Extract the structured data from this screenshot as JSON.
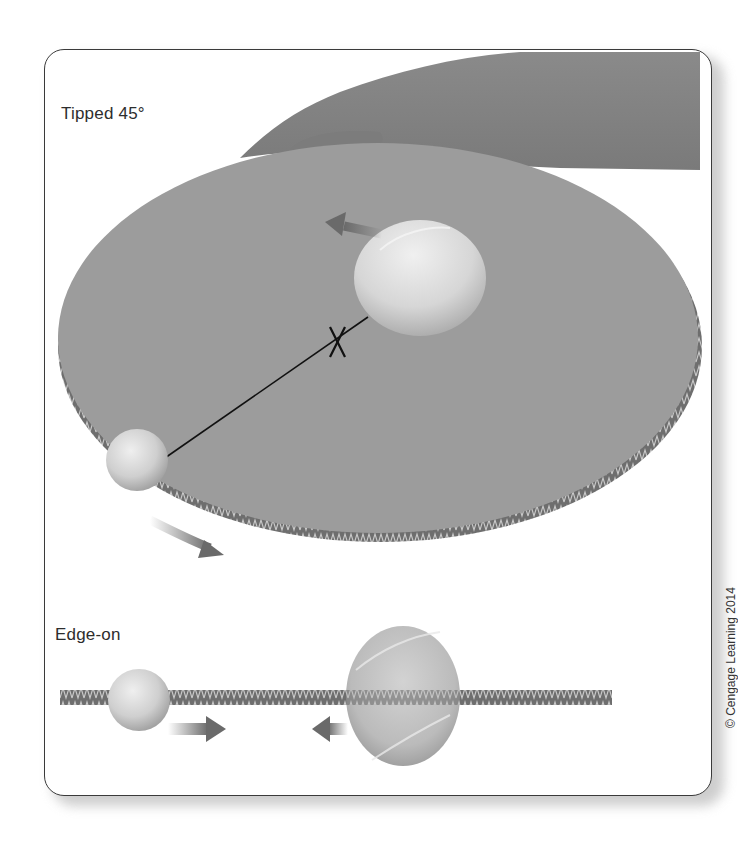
{
  "figure": {
    "top_panel": {
      "label": "Tipped 45°",
      "elements": [
        "hand-holding-disc",
        "cardboard-disc",
        "large-ball",
        "small-ball",
        "center-of-mass-marker",
        "connecting-line",
        "motion-arrow-large",
        "motion-arrow-small"
      ]
    },
    "bottom_panel": {
      "label": "Edge-on",
      "elements": [
        "corrugated-disc-edge",
        "small-ball",
        "large-ball",
        "motion-arrow-right",
        "motion-arrow-left"
      ]
    },
    "credit": "© Cengage Learning 2014"
  },
  "colors": {
    "disc": "#9a9a9a",
    "disc_edge": "#6e6e6e",
    "hand": "#8e8e8e",
    "ball_light": "#e6e6e6",
    "ball_dark": "#a8a8a8",
    "arrow": "#6a6a6a",
    "frame": "#3a3a3a"
  }
}
